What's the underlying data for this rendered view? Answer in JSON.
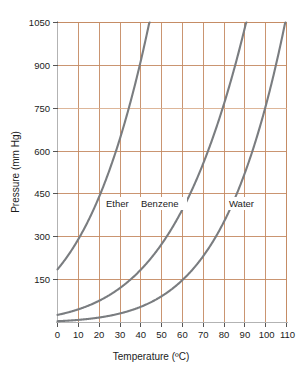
{
  "chart_data": {
    "type": "line",
    "title": "",
    "xlabel": "Temperature (ºC)",
    "ylabel": "Pressure (mm Hg)",
    "xlim": [
      0,
      110
    ],
    "ylim": [
      0,
      1050
    ],
    "xticks": [
      0,
      10,
      20,
      30,
      40,
      50,
      60,
      70,
      80,
      90,
      100,
      110
    ],
    "xtick_labels": [
      "0",
      "10",
      "20",
      "30",
      "40",
      "50",
      "60",
      "70",
      "80",
      "90",
      "100",
      "110"
    ],
    "yticks": [
      150,
      300,
      450,
      600,
      750,
      900,
      1050
    ],
    "ytick_labels": [
      "150",
      "300",
      "450",
      "600",
      "750",
      "900",
      "1050"
    ],
    "grid": true,
    "grid_color": "#c48a62",
    "highlight_line": {
      "value": 750,
      "label": "750",
      "color": "#d08a54"
    },
    "legend_position": "inline-annotations",
    "curve_color": "#7a7d80",
    "series": [
      {
        "name": "Ether",
        "label": "Ether",
        "label_x": 22,
        "label_y": 395,
        "boiling_point_760": 35,
        "points": [
          [
            0,
            185
          ],
          [
            5,
            225
          ],
          [
            10,
            290
          ],
          [
            15,
            360
          ],
          [
            20,
            442
          ],
          [
            25,
            535
          ],
          [
            30,
            640
          ],
          [
            35,
            760
          ],
          [
            40,
            900
          ],
          [
            44,
            1050
          ]
        ]
      },
      {
        "name": "Benzene",
        "label": "Benzene",
        "label_x": 42,
        "label_y": 395,
        "boiling_point_760": 80,
        "points": [
          [
            0,
            27
          ],
          [
            10,
            45
          ],
          [
            20,
            75
          ],
          [
            28,
            150
          ],
          [
            30,
            118
          ],
          [
            40,
            180
          ],
          [
            50,
            270
          ],
          [
            60,
            390
          ],
          [
            70,
            545
          ],
          [
            80,
            752
          ],
          [
            87,
            1050
          ]
        ]
      },
      {
        "name": "Water",
        "label": "Water",
        "label_x": 85,
        "label_y": 395,
        "boiling_point_760": 100,
        "points": [
          [
            0,
            5
          ],
          [
            10,
            9
          ],
          [
            20,
            18
          ],
          [
            30,
            32
          ],
          [
            40,
            55
          ],
          [
            50,
            93
          ],
          [
            60,
            150
          ],
          [
            70,
            234
          ],
          [
            80,
            355
          ],
          [
            90,
            526
          ],
          [
            100,
            755
          ],
          [
            110,
            1050
          ]
        ]
      }
    ]
  },
  "axes": {
    "y_title": "Pressure (mm Hg)",
    "x_title": "Temperature (ºC)"
  },
  "labels": {
    "ether": "Ether",
    "benzene": "Benzene",
    "water": "Water"
  },
  "yticks": {
    "t0": "1050",
    "t1": "900",
    "t2": "750",
    "t3": "600",
    "t4": "450",
    "t5": "300",
    "t6": "150"
  },
  "xticks": {
    "t0": "0",
    "t1": "10",
    "t2": "20",
    "t3": "30",
    "t4": "40",
    "t5": "50",
    "t6": "60",
    "t7": "70",
    "t8": "80",
    "t9": "90",
    "t10": "100",
    "t11": "110"
  }
}
